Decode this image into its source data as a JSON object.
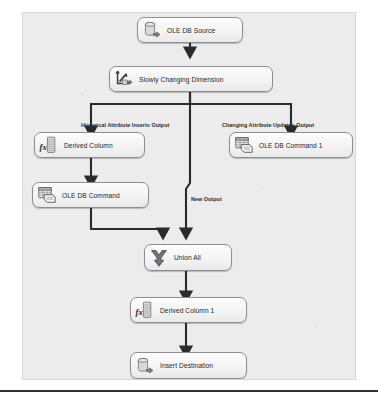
{
  "figure": {
    "kind": "ssis-data-flow-diagram",
    "canvas_background": "#ececed",
    "node_border": "#8e8e90",
    "connector_color": "#2b2b2b"
  },
  "nodes": [
    {
      "id": "ole-db-source",
      "label": "OLE DB Source",
      "icon": "database-cylinder-arrow-icon",
      "x": 136,
      "y": 16,
      "w": 106,
      "h": 26
    },
    {
      "id": "slowly-changing-dimension",
      "label": "Slowly Changing Dimension",
      "icon": "scd-axis-arrow-icon",
      "x": 108,
      "y": 65,
      "w": 164,
      "h": 26
    },
    {
      "id": "derived-column",
      "label": "Derived Column",
      "icon": "fx-column-icon",
      "x": 33,
      "y": 131,
      "w": 111,
      "h": 26
    },
    {
      "id": "ole-db-command-1",
      "label": "OLE DB Command 1",
      "icon": "table-command-icon",
      "x": 228,
      "y": 131,
      "w": 124,
      "h": 26
    },
    {
      "id": "ole-db-command",
      "label": "OLE DB Command",
      "icon": "table-command-icon",
      "x": 31,
      "y": 181,
      "w": 117,
      "h": 26
    },
    {
      "id": "union-all",
      "label": "Union All",
      "icon": "union-funnel-icon",
      "x": 143,
      "y": 243,
      "w": 88,
      "h": 27
    },
    {
      "id": "derived-column-1",
      "label": "Derived Column 1",
      "icon": "fx-column-icon",
      "x": 129,
      "y": 296,
      "w": 117,
      "h": 26
    },
    {
      "id": "insert-destination",
      "label": "Insert Destination",
      "icon": "database-cylinder-arrow-icon",
      "x": 129,
      "y": 351,
      "w": 117,
      "h": 27
    }
  ],
  "edge_labels": [
    {
      "id": "historical-attribute-inserts-output",
      "text": "Historical Attribute Inserts Output",
      "x": 58,
      "y": 110
    },
    {
      "id": "changing-attribute-updates-output",
      "text": "Changing Attribute Updates Output",
      "x": 199,
      "y": 110
    },
    {
      "id": "new-output",
      "text": "New Output",
      "x": 168,
      "y": 184
    }
  ],
  "edges": [
    {
      "id": "source-to-scd",
      "from": "ole-db-source",
      "to": "slowly-changing-dimension"
    },
    {
      "id": "scd-to-derived-column",
      "from": "slowly-changing-dimension",
      "to": "derived-column",
      "label": "Historical Attribute Inserts Output"
    },
    {
      "id": "scd-to-ole-db-command-1",
      "from": "slowly-changing-dimension",
      "to": "ole-db-command-1",
      "label": "Changing Attribute Updates Output"
    },
    {
      "id": "scd-to-union-all",
      "from": "slowly-changing-dimension",
      "to": "union-all",
      "label": "New Output"
    },
    {
      "id": "derived-column-to-ole-db-command",
      "from": "derived-column",
      "to": "ole-db-command"
    },
    {
      "id": "ole-db-command-to-union-all",
      "from": "ole-db-command",
      "to": "union-all"
    },
    {
      "id": "union-all-to-derived-column-1",
      "from": "union-all",
      "to": "derived-column-1"
    },
    {
      "id": "derived-column-1-to-insert-destination",
      "from": "derived-column-1",
      "to": "insert-destination"
    }
  ]
}
